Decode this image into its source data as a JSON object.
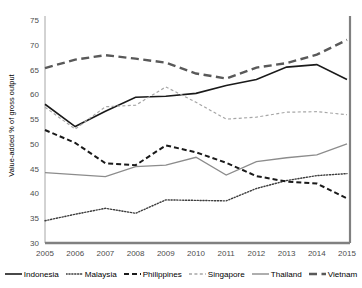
{
  "chart_data": {
    "type": "line",
    "title": "",
    "xlabel": "",
    "ylabel": "Value-added % of gross output",
    "x": [
      2005,
      2006,
      2007,
      2008,
      2009,
      2010,
      2011,
      2012,
      2013,
      2014,
      2015
    ],
    "xtick_labels": [
      "2005",
      "2006",
      "2007",
      "2008",
      "2009",
      "2010",
      "2011",
      "2012",
      "2013",
      "2014",
      "2015"
    ],
    "ytick_labels": [
      "30",
      "35",
      "40",
      "45",
      "50",
      "55",
      "60",
      "65",
      "70",
      "75"
    ],
    "yticks": [
      30,
      35,
      40,
      45,
      50,
      55,
      60,
      65,
      70,
      75
    ],
    "ylim": [
      30,
      75
    ],
    "xlim": [
      2005,
      2015
    ],
    "grid": false,
    "legend_position": "bottom",
    "series": [
      {
        "name": "Indonesia",
        "style": "solid",
        "color": "#1a1a1a",
        "width": 1.6,
        "values": [
          58.0,
          53.5,
          56.6,
          59.4,
          59.6,
          60.2,
          61.8,
          63.0,
          65.5,
          66.0,
          63.0
        ]
      },
      {
        "name": "Malaysia",
        "style": "dotted",
        "color": "#3d3d3d",
        "width": 1.4,
        "values": [
          34.5,
          35.8,
          37.0,
          36.0,
          38.7,
          38.6,
          38.5,
          41.0,
          42.6,
          43.6,
          44.0
        ]
      },
      {
        "name": "Philippines",
        "style": "dash-bold",
        "color": "#1a1a1a",
        "width": 2.0,
        "values": [
          52.8,
          50.2,
          46.1,
          45.7,
          49.7,
          48.3,
          46.2,
          43.5,
          42.4,
          42.0,
          39.0
        ]
      },
      {
        "name": "Singapore",
        "style": "dash-light",
        "color": "#a6a6a6",
        "width": 1.2,
        "values": [
          57.4,
          53.0,
          57.5,
          57.8,
          61.5,
          58.4,
          55.0,
          55.4,
          56.4,
          56.5,
          55.9
        ]
      },
      {
        "name": "Thailand",
        "style": "solid-gray",
        "color": "#8c8c8c",
        "width": 1.3,
        "values": [
          44.2,
          43.8,
          43.4,
          45.4,
          45.7,
          47.3,
          43.7,
          46.4,
          47.2,
          47.8,
          50.0
        ]
      },
      {
        "name": "Vietnam",
        "style": "dash-dot",
        "color": "#595959",
        "width": 2.4,
        "values": [
          65.3,
          67.0,
          67.9,
          67.2,
          66.4,
          64.2,
          63.2,
          65.4,
          66.3,
          68.0,
          71.0
        ]
      }
    ]
  },
  "axis": {
    "border_color": "#a6a6a6",
    "tick_color": "#4d4d4d",
    "bottom_axis_color": "#808080",
    "right_axis_color": "#808080"
  }
}
